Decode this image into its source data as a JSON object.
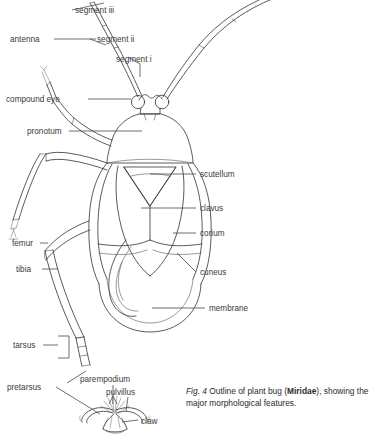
{
  "figure": {
    "caption_prefix": "Fig. 4",
    "caption_line1": " Outline of plant bug (",
    "caption_taxon": "Miridae",
    "caption_line2": "), showing the major morphological features.",
    "ink_color": "#3d3d3d",
    "text_color": "#2b2b2b",
    "background": "#ffffff"
  },
  "labels": {
    "segment_iii": "segment iii",
    "antenna": "antenna",
    "segment_ii": "segment ii",
    "segment_i": "segment i",
    "compound_eye": "compound eye",
    "pronotum": "pronotum",
    "scutellum": "scutellum",
    "clavus": "clavus",
    "corium": "corium",
    "cuneus": "cuneus",
    "femur": "femur",
    "tibia": "tibia",
    "membrane": "membrane",
    "tarsus": "tarsus",
    "pretarsus": "pretarsus",
    "parempodium": "parempodium",
    "pulvillus": "pulvillus",
    "claw": "claw"
  }
}
